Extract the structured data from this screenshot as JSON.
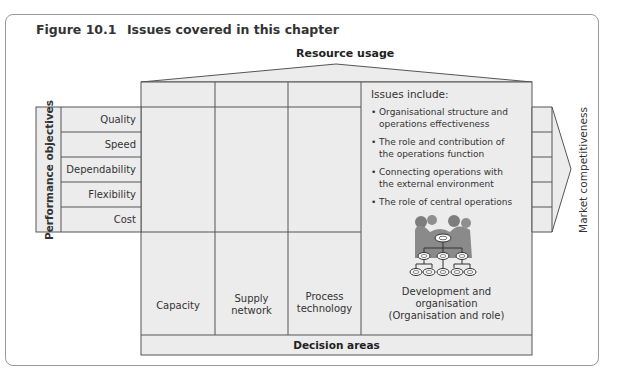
{
  "figure": {
    "number": "Figure 10.1",
    "title": "Issues covered in this chapter"
  },
  "top_label": "Resource usage",
  "left_axis_label": "Performance objectives",
  "right_axis_label": "Market competitiveness",
  "bottom_label": "Decision areas",
  "performance_objectives": [
    "Quality",
    "Speed",
    "Dependability",
    "Flexibility",
    "Cost"
  ],
  "decision_columns": [
    {
      "label_line1": "Capacity",
      "label_line2": ""
    },
    {
      "label_line1": "Supply",
      "label_line2": "network"
    },
    {
      "label_line1": "Process",
      "label_line2": "technology"
    }
  ],
  "highlight_panel": {
    "heading": "Issues include:",
    "issues": [
      {
        "line1": "Organisational structure and",
        "line2": "operations effectiveness"
      },
      {
        "line1": "The role and contribution of",
        "line2": "the operations function"
      },
      {
        "line1": "Connecting operations with",
        "line2": "the external environment"
      },
      {
        "line1": "The role of central operations",
        "line2": ""
      }
    ],
    "icon": "organisation-chart-icon",
    "caption_line1": "Development and",
    "caption_line2": "organisation",
    "caption_line3": "(Organisation and role)"
  },
  "colors": {
    "panel_fill": "#ececec",
    "line": "#555555",
    "frame": "#9a9a9a",
    "icon_fill": "#8a8a8a"
  }
}
